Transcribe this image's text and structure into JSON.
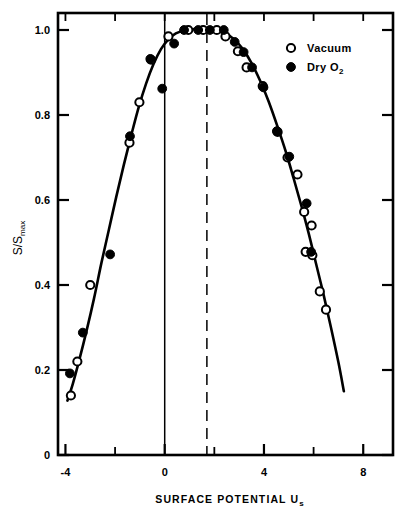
{
  "chart_data": {
    "type": "scatter",
    "title": "",
    "xlabel": "SURFACE POTENTIAL U",
    "xlabel_sub": "s",
    "ylabel": "S/S",
    "ylabel_sub": "max",
    "xlim": [
      -4.3,
      9.2
    ],
    "ylim": [
      0,
      1.04
    ],
    "x_ticks_major": [
      -4,
      0,
      4,
      8
    ],
    "x_ticks_major_labels": [
      "-4",
      "0",
      "4",
      "8"
    ],
    "x_ticks_minor": [
      -2,
      2,
      6
    ],
    "y_ticks_major": [
      0,
      0.2,
      0.4,
      0.6,
      0.8,
      1.0
    ],
    "y_ticks_major_labels": [
      "0",
      "0.2",
      "0.4",
      "0.6",
      "0.8",
      "1.0"
    ],
    "grid": false,
    "legend_position": "top-right",
    "reference_lines": [
      {
        "name": "zero-potential-line",
        "x": 0,
        "style": "solid"
      },
      {
        "name": "peak-potential-line",
        "x": 1.7,
        "style": "dashed"
      }
    ],
    "series": [
      {
        "name": "Vacuum",
        "marker": "open-circle",
        "points": [
          [
            -3.78,
            0.14
          ],
          [
            -3.52,
            0.22
          ],
          [
            -3.0,
            0.4
          ],
          [
            -1.42,
            0.735
          ],
          [
            -1.02,
            0.83
          ],
          [
            -0.55,
            0.93
          ],
          [
            0.15,
            0.985
          ],
          [
            0.95,
            1.0
          ],
          [
            1.55,
            1.0
          ],
          [
            2.1,
            1.0
          ],
          [
            2.45,
            0.985
          ],
          [
            2.95,
            0.95
          ],
          [
            3.3,
            0.912
          ],
          [
            3.95,
            0.868
          ],
          [
            4.55,
            0.76
          ],
          [
            4.95,
            0.7
          ],
          [
            5.35,
            0.66
          ],
          [
            5.62,
            0.572
          ],
          [
            5.92,
            0.54
          ],
          [
            5.68,
            0.478
          ],
          [
            5.95,
            0.47
          ],
          [
            6.25,
            0.385
          ],
          [
            6.5,
            0.342
          ]
        ]
      },
      {
        "name": "Dry O2",
        "marker": "filled-circle",
        "points": [
          [
            -3.82,
            0.192
          ],
          [
            -3.3,
            0.288
          ],
          [
            -2.2,
            0.472
          ],
          [
            -1.4,
            0.75
          ],
          [
            -0.58,
            0.932
          ],
          [
            -0.1,
            0.862
          ],
          [
            0.38,
            0.968
          ],
          [
            0.78,
            1.0
          ],
          [
            1.35,
            1.0
          ],
          [
            1.82,
            1.0
          ],
          [
            2.38,
            1.0
          ],
          [
            2.82,
            0.972
          ],
          [
            3.18,
            0.948
          ],
          [
            3.52,
            0.912
          ],
          [
            3.98,
            0.865
          ],
          [
            4.52,
            0.762
          ],
          [
            5.02,
            0.702
          ],
          [
            5.72,
            0.592
          ],
          [
            5.9,
            0.478
          ]
        ]
      }
    ],
    "fit_curve": {
      "name": "fitted-bell-curve",
      "points": [
        [
          -3.92,
          0.128
        ],
        [
          -3.7,
          0.168
        ],
        [
          -3.45,
          0.222
        ],
        [
          -3.15,
          0.292
        ],
        [
          -2.85,
          0.368
        ],
        [
          -2.55,
          0.452
        ],
        [
          -2.25,
          0.53
        ],
        [
          -1.95,
          0.608
        ],
        [
          -1.65,
          0.682
        ],
        [
          -1.35,
          0.752
        ],
        [
          -1.05,
          0.818
        ],
        [
          -0.75,
          0.874
        ],
        [
          -0.45,
          0.92
        ],
        [
          -0.15,
          0.955
        ],
        [
          0.15,
          0.978
        ],
        [
          0.45,
          0.992
        ],
        [
          0.8,
          0.999
        ],
        [
          1.2,
          1.002
        ],
        [
          1.7,
          1.003
        ],
        [
          2.1,
          1.0
        ],
        [
          2.45,
          0.992
        ],
        [
          2.8,
          0.978
        ],
        [
          3.15,
          0.955
        ],
        [
          3.5,
          0.922
        ],
        [
          3.85,
          0.88
        ],
        [
          4.2,
          0.83
        ],
        [
          4.55,
          0.772
        ],
        [
          4.9,
          0.71
        ],
        [
          5.2,
          0.65
        ],
        [
          5.5,
          0.588
        ],
        [
          5.8,
          0.522
        ],
        [
          6.1,
          0.45
        ],
        [
          6.4,
          0.378
        ],
        [
          6.7,
          0.3
        ],
        [
          7.0,
          0.218
        ],
        [
          7.22,
          0.15
        ]
      ]
    },
    "legend": [
      {
        "label": "Vacuum",
        "marker": "open-circle"
      },
      {
        "label": "Dry O",
        "sub": "2",
        "marker": "filled-circle"
      }
    ]
  },
  "plot_frame": {
    "left_px": 58,
    "right_px": 393,
    "top_px": 13,
    "bottom_px": 455
  },
  "colors": {
    "ink": "#000000",
    "paper": "#ffffff"
  }
}
